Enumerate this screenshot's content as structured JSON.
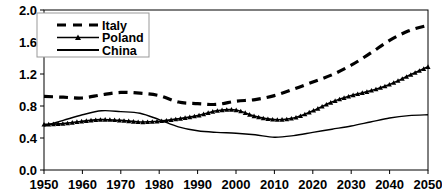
{
  "chart_data": {
    "type": "line",
    "title": "",
    "xlabel": "",
    "ylabel": "",
    "xlim": [
      1950,
      2050
    ],
    "ylim": [
      0.0,
      2.0
    ],
    "grid": false,
    "legend_position": "top-left",
    "x_ticks": [
      "1950",
      "1960",
      "1970",
      "1980",
      "1990",
      "2000",
      "2010",
      "2020",
      "2030",
      "2040",
      "2050"
    ],
    "y_ticks": [
      "0.0",
      "0.4",
      "0.8",
      "1.2",
      "1.6",
      "2.0"
    ],
    "x": [
      1950,
      1955,
      1960,
      1965,
      1970,
      1975,
      1980,
      1985,
      1990,
      1995,
      2000,
      2005,
      2010,
      2015,
      2020,
      2025,
      2030,
      2035,
      2040,
      2045,
      2050
    ],
    "series": [
      {
        "name": "Italy",
        "style": "dashed",
        "marker": "none",
        "color": "#000000",
        "values": [
          0.92,
          0.91,
          0.9,
          0.94,
          0.97,
          0.96,
          0.93,
          0.85,
          0.83,
          0.82,
          0.86,
          0.88,
          0.93,
          1.01,
          1.1,
          1.19,
          1.31,
          1.46,
          1.62,
          1.74,
          1.81
        ]
      },
      {
        "name": "Poland",
        "style": "solid",
        "marker": "triangle",
        "color": "#000000",
        "values": [
          0.57,
          0.58,
          0.61,
          0.63,
          0.62,
          0.6,
          0.61,
          0.64,
          0.68,
          0.74,
          0.75,
          0.67,
          0.63,
          0.65,
          0.74,
          0.85,
          0.93,
          0.99,
          1.07,
          1.18,
          1.29
        ]
      },
      {
        "name": "China",
        "style": "solid",
        "marker": "none",
        "color": "#000000",
        "values": [
          0.55,
          0.62,
          0.69,
          0.74,
          0.73,
          0.71,
          0.63,
          0.54,
          0.49,
          0.47,
          0.46,
          0.44,
          0.41,
          0.43,
          0.47,
          0.51,
          0.55,
          0.6,
          0.65,
          0.68,
          0.69
        ]
      }
    ]
  },
  "legend": {
    "entries": [
      {
        "label": "Italy"
      },
      {
        "label": "Poland"
      },
      {
        "label": "China"
      }
    ]
  }
}
